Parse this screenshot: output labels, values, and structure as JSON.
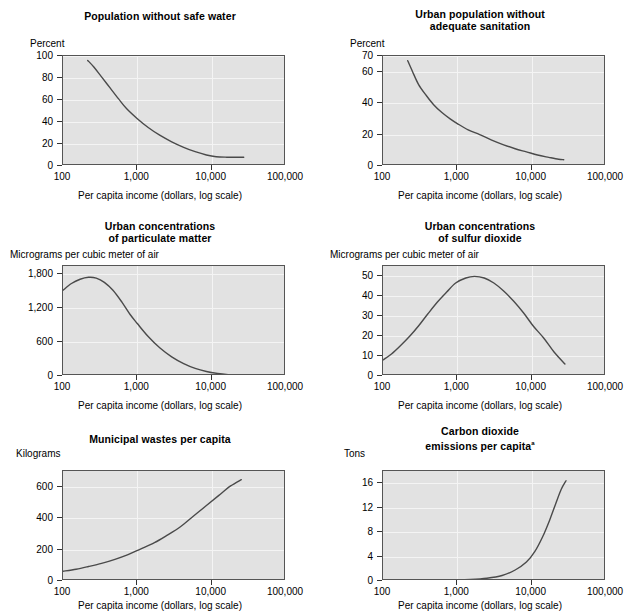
{
  "figure": {
    "shared_xlabel": "Per capita income (dollars, log scale)",
    "x_tick_labels": [
      "100",
      "1,000",
      "10,000",
      "100,000"
    ],
    "x_ticks": [
      100,
      1000,
      10000,
      100000
    ],
    "xlim": [
      100,
      100000
    ],
    "curve_color": "#4a4a4a",
    "plot_bg": "#e2e2e2",
    "grid_color": "#f4f4f4",
    "frame_color": "#555555"
  },
  "chart_data": [
    {
      "id": "population-without-safe-water",
      "type": "line",
      "title": "Population without safe water",
      "ylabel": "Percent",
      "xlabel": "Per capita income (dollars, log scale)",
      "xlabel_visible": true,
      "x_log": true,
      "xlim": [
        100,
        100000
      ],
      "ylim": [
        0,
        100
      ],
      "y_ticks": [
        0,
        20,
        40,
        60,
        80,
        100
      ],
      "y_tick_labels": [
        "0",
        "20",
        "40",
        "60",
        "80",
        "100"
      ],
      "grid": true,
      "legend": "none",
      "x": [
        215,
        260,
        330,
        430,
        560,
        720,
        1000,
        1400,
        2000,
        2900,
        4200,
        6000,
        8500,
        11500,
        16000,
        22000,
        27000
      ],
      "y": [
        96,
        90,
        81,
        71,
        61,
        52,
        43,
        35,
        28,
        22,
        17,
        13,
        10,
        8.4,
        8,
        8,
        8
      ]
    },
    {
      "id": "urban-population-without-adequate-sanitation",
      "type": "line",
      "title": "Urban population without adequate sanitation",
      "title_lines": [
        "Urban population without",
        "adequate sanitation"
      ],
      "ylabel": "Percent",
      "xlabel": "Per capita income (dollars, log scale)",
      "xlabel_visible": true,
      "x_log": true,
      "xlim": [
        100,
        100000
      ],
      "ylim": [
        0,
        70
      ],
      "y_ticks": [
        0,
        20,
        40,
        60,
        70
      ],
      "y_tick_labels": [
        "0",
        "20",
        "40",
        "60",
        "70"
      ],
      "grid": true,
      "legend": "none",
      "x": [
        215,
        250,
        300,
        380,
        480,
        620,
        800,
        1000,
        1400,
        2000,
        2900,
        4200,
        6000,
        8500,
        12000,
        17000,
        23000,
        27000
      ],
      "y": [
        67,
        60,
        52,
        45,
        39,
        34,
        30,
        27,
        23,
        20,
        16.5,
        13.5,
        11,
        9,
        7,
        5.5,
        4.3,
        4
      ]
    },
    {
      "id": "urban-concentrations-of-particulate-matter",
      "type": "line",
      "title": "Urban concentrations of particulate matter",
      "title_lines": [
        "Urban concentrations",
        "of particulate matter"
      ],
      "ylabel": "Micrograms per cubic meter of air",
      "xlabel": "Per capita income (dollars, log scale)",
      "xlabel_visible": true,
      "x_log": true,
      "xlim": [
        100,
        100000
      ],
      "ylim": [
        0,
        1950
      ],
      "y_ticks": [
        0,
        600,
        1200,
        1800
      ],
      "y_tick_labels": [
        "0",
        "600",
        "1,200",
        "1,800"
      ],
      "grid": true,
      "legend": "none",
      "x": [
        100,
        130,
        170,
        220,
        280,
        360,
        470,
        620,
        800,
        1000,
        1400,
        2000,
        2900,
        4200,
        6000,
        8500,
        12000,
        17000,
        23000,
        30000
      ],
      "y": [
        1520,
        1640,
        1715,
        1750,
        1735,
        1660,
        1520,
        1310,
        1090,
        930,
        700,
        500,
        340,
        220,
        135,
        80,
        45,
        22,
        10,
        5
      ]
    },
    {
      "id": "urban-concentrations-of-sulfur-dioxide",
      "type": "line",
      "title": "Urban concentrations of sulfur dioxide",
      "title_lines": [
        "Urban concentrations",
        "of sulfur dioxide"
      ],
      "ylabel": "Micrograms per cubic meter of air",
      "xlabel": "Per capita income (dollars, log scale)",
      "xlabel_visible": true,
      "x_log": true,
      "xlim": [
        100,
        100000
      ],
      "ylim": [
        0,
        55
      ],
      "y_ticks": [
        0,
        10,
        20,
        30,
        40,
        50
      ],
      "y_tick_labels": [
        "0",
        "10",
        "20",
        "30",
        "40",
        "50"
      ],
      "grid": true,
      "legend": "none",
      "x": [
        100,
        130,
        170,
        230,
        300,
        400,
        540,
        720,
        950,
        1300,
        1700,
        2300,
        3100,
        4200,
        5700,
        7800,
        10500,
        14500,
        20000,
        28000
      ],
      "y": [
        8,
        11,
        15,
        20,
        25,
        31,
        37,
        42,
        46.5,
        49,
        49.8,
        49,
        46.5,
        42.5,
        37.5,
        31.5,
        25,
        19,
        12,
        6
      ]
    },
    {
      "id": "municipal-wastes-per-capita",
      "type": "line",
      "title": "Municipal wastes per capita",
      "ylabel": "Kilograms",
      "xlabel": "Per capita income (dollars, log scale)",
      "xlabel_visible": true,
      "x_log": true,
      "xlim": [
        100,
        100000
      ],
      "ylim": [
        0,
        700
      ],
      "y_ticks": [
        0,
        200,
        400,
        600
      ],
      "y_tick_labels": [
        "0",
        "200",
        "400",
        "600"
      ],
      "grid": true,
      "legend": "none",
      "x": [
        100,
        150,
        220,
        330,
        500,
        750,
        1100,
        1700,
        2500,
        3800,
        5600,
        8500,
        12500,
        18000,
        25000
      ],
      "y": [
        62,
        75,
        92,
        112,
        138,
        168,
        203,
        244,
        290,
        345,
        410,
        480,
        545,
        605,
        645
      ]
    },
    {
      "id": "carbon-dioxide-emissions-per-capita",
      "type": "line",
      "title": "Carbon dioxide emissions per capita",
      "title_lines": [
        "Carbon dioxide",
        "emissions per capita"
      ],
      "title_superscript": "a",
      "ylabel": "Tons",
      "xlabel": "Per capita income (dollars, log scale)",
      "xlabel_visible": true,
      "x_log": true,
      "xlim": [
        100,
        100000
      ],
      "ylim": [
        0,
        18
      ],
      "y_ticks": [
        0,
        4,
        8,
        12,
        16
      ],
      "y_tick_labels": [
        "0",
        "4",
        "8",
        "12",
        "16"
      ],
      "grid": true,
      "legend": "none",
      "x": [
        100,
        200,
        400,
        800,
        1500,
        2500,
        4000,
        6000,
        8500,
        11000,
        14000,
        17500,
        21000,
        25000,
        29000
      ],
      "y": [
        0.05,
        0.07,
        0.1,
        0.15,
        0.25,
        0.45,
        0.9,
        1.8,
        3.1,
        4.8,
        7.2,
        10.0,
        12.6,
        15.0,
        16.4
      ]
    }
  ]
}
